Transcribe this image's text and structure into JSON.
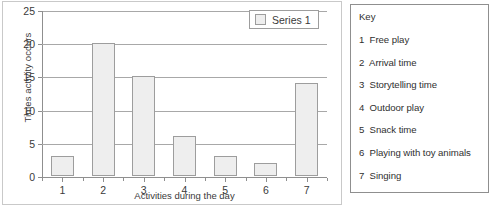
{
  "chart_data": {
    "type": "bar",
    "title": "",
    "xlabel": "Activities during the day",
    "ylabel": "Times activity occurs",
    "categories": [
      "1",
      "2",
      "3",
      "4",
      "5",
      "6",
      "7"
    ],
    "values": [
      3,
      20,
      15,
      6,
      3,
      2,
      14
    ],
    "series": [
      {
        "name": "Series 1",
        "values": [
          3,
          20,
          15,
          6,
          3,
          2,
          14
        ]
      }
    ],
    "ylim": [
      0,
      25
    ],
    "yticks": [
      0,
      5,
      10,
      15,
      20,
      25
    ],
    "ytick_labels": [
      "0",
      "5",
      "10",
      "15",
      "20",
      "25"
    ],
    "grid": true,
    "legend_position": "top-right",
    "bar_color": "#eeeeee",
    "bar_border_color": "#9d9d9d",
    "gridline_color": "#a8a8a8",
    "axis_color": "#8f8f8f"
  },
  "legend": {
    "series_label": "Series 1"
  },
  "key_panel": {
    "heading": "Key",
    "items": [
      {
        "num": "1",
        "label": "Free play"
      },
      {
        "num": "2",
        "label": "Arrival time"
      },
      {
        "num": "3",
        "label": "Storytelling time"
      },
      {
        "num": "4",
        "label": "Outdoor play"
      },
      {
        "num": "5",
        "label": "Snack time"
      },
      {
        "num": "6",
        "label": "Playing with toy animals"
      },
      {
        "num": "7",
        "label": "Singing"
      }
    ]
  }
}
